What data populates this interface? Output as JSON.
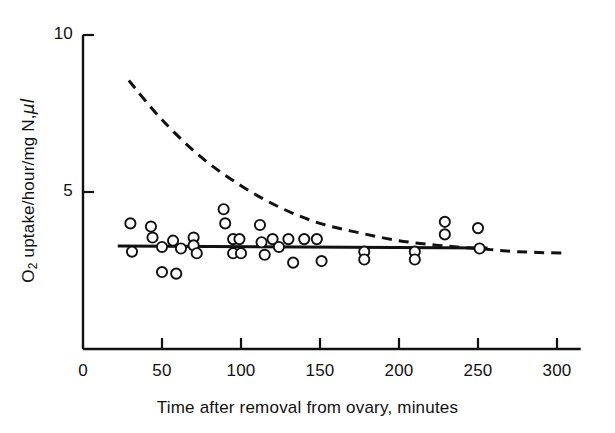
{
  "chart_data": {
    "type": "scatter",
    "title": "",
    "xlabel": "Time after removal from ovary, minutes",
    "ylabel_parts": {
      "prefix": "O",
      "subscript": "2",
      "suffix": " uptake/hour/mg N,",
      "unit": "μl"
    },
    "ylabel": "O2 uptake/hour/mg N, μl",
    "xlim": [
      0,
      315
    ],
    "ylim": [
      0,
      10
    ],
    "xticks": [
      0,
      50,
      100,
      150,
      200,
      250,
      300
    ],
    "xticklabels": [
      "0",
      "50",
      "100",
      "150",
      "200",
      "250",
      "300"
    ],
    "yticks": [
      0,
      5,
      10
    ],
    "yticklabels": [
      "",
      "5",
      "10"
    ],
    "grid": false,
    "legend": null,
    "axis_color": "#111111",
    "marker_color": "#111111",
    "marker_style": "open-circle",
    "series": [
      {
        "name": "observed O2 uptake",
        "type": "scatter",
        "points": [
          [
            30,
            4.0
          ],
          [
            31,
            3.1
          ],
          [
            43,
            3.9
          ],
          [
            44,
            3.55
          ],
          [
            50,
            3.25
          ],
          [
            50,
            2.45
          ],
          [
            57,
            3.45
          ],
          [
            59,
            2.4
          ],
          [
            62,
            3.2
          ],
          [
            70,
            3.55
          ],
          [
            70,
            3.3
          ],
          [
            72,
            3.05
          ],
          [
            89,
            4.45
          ],
          [
            90,
            4.0
          ],
          [
            95,
            3.5
          ],
          [
            95,
            3.05
          ],
          [
            99,
            3.5
          ],
          [
            100,
            3.05
          ],
          [
            112,
            3.95
          ],
          [
            113,
            3.4
          ],
          [
            115,
            3.0
          ],
          [
            120,
            3.5
          ],
          [
            124,
            3.25
          ],
          [
            130,
            3.5
          ],
          [
            133,
            2.75
          ],
          [
            140,
            3.5
          ],
          [
            148,
            3.5
          ],
          [
            151,
            2.8
          ],
          [
            178,
            3.1
          ],
          [
            178,
            2.85
          ],
          [
            210,
            3.1
          ],
          [
            210,
            2.85
          ],
          [
            229,
            4.05
          ],
          [
            229,
            3.65
          ],
          [
            250,
            3.85
          ],
          [
            251,
            3.2
          ]
        ]
      },
      {
        "name": "fitted linear regression",
        "type": "line",
        "style": "solid",
        "points": [
          [
            22,
            3.28
          ],
          [
            256,
            3.22
          ]
        ]
      },
      {
        "name": "theoretical exponential decay",
        "type": "line",
        "style": "dashed",
        "points": [
          [
            29,
            8.55
          ],
          [
            50,
            7.3
          ],
          [
            75,
            6.1
          ],
          [
            100,
            5.2
          ],
          [
            125,
            4.5
          ],
          [
            150,
            4.0
          ],
          [
            175,
            3.7
          ],
          [
            200,
            3.45
          ],
          [
            225,
            3.3
          ],
          [
            250,
            3.2
          ],
          [
            275,
            3.1
          ],
          [
            306,
            3.05
          ]
        ]
      }
    ]
  },
  "axes": {
    "x_title": "Time after removal from ovary, minutes",
    "y_title_prefix": "O",
    "y_title_sub": "2",
    "y_title_rest": " uptake/hour/mg N,",
    "y_title_unit": "μl"
  },
  "ticks": {
    "x": [
      {
        "value": 0,
        "label": "0"
      },
      {
        "value": 50,
        "label": "50"
      },
      {
        "value": 100,
        "label": "100"
      },
      {
        "value": 150,
        "label": "150"
      },
      {
        "value": 200,
        "label": "200"
      },
      {
        "value": 250,
        "label": "250"
      },
      {
        "value": 300,
        "label": "300"
      }
    ],
    "y": [
      {
        "value": 5,
        "label": "5"
      },
      {
        "value": 10,
        "label": "10"
      }
    ]
  }
}
